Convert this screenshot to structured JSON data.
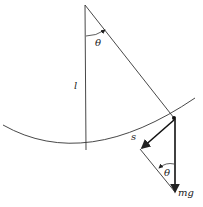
{
  "diagram": {
    "type": "simple pendulum force diagram",
    "labels": {
      "theta_top": "θ",
      "length": "l",
      "arc": "s",
      "theta_bottom": "θ",
      "weight": "mg"
    }
  }
}
